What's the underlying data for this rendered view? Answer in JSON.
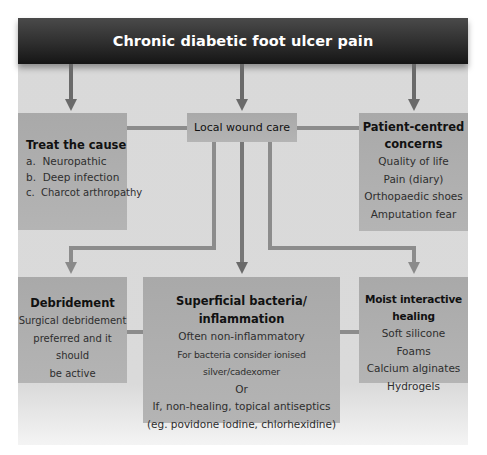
{
  "header": {
    "title": "Chronic diabetic foot ulcer pain"
  },
  "nodes": {
    "treat_cause": {
      "title": "Treat the cause",
      "items": [
        "a.  Neuropathic",
        "b.  Deep infection",
        "c.  Charcot arthropathy"
      ]
    },
    "local_wound_care": {
      "title": "Local wound care"
    },
    "patient_centred": {
      "title_line1": "Patient-centred",
      "title_line2": "concerns",
      "items": [
        "Quality of life",
        "Pain (diary)",
        "Orthopaedic shoes",
        "Amputation fear"
      ]
    },
    "debridement": {
      "title": "Debridement",
      "items": [
        "Surgical debridement",
        "preferred and it should",
        "be active"
      ]
    },
    "superficial_bacteria": {
      "title_line1": "Superficial bacteria/",
      "title_line2": "inflammation",
      "items": [
        "Often non-inflammatory",
        "For bacteria consider ionised silver/cadexomer",
        "Or",
        "If, non-healing, topical antiseptics",
        "(eg. povidone iodine, chlorhexidine)"
      ]
    },
    "moist_healing": {
      "title": "Moist interactive healing",
      "items": [
        "Soft silicone",
        "Foams",
        "Calcium alginates",
        "Hydrogels"
      ]
    }
  },
  "colors": {
    "header_bg": "#222222",
    "panel_bg": "#d9d9d9",
    "box_bg": "#adadad",
    "connector": "#8c8c8c",
    "arrow": "#6a6a6a"
  }
}
